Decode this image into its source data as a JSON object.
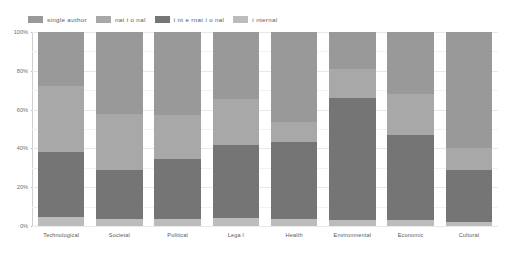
{
  "chart": {
    "type": "bar",
    "title": "",
    "xlabel": "",
    "ylabel": ""
  },
  "legend": {
    "position": "top-left",
    "items": [
      {
        "label": "single author",
        "color": "#999999"
      },
      {
        "label": "nat i o nal",
        "color": "#a8a8a8"
      },
      {
        "label": "i nt e rnat i o nal",
        "color": "#757575"
      },
      {
        "label": "i nternal",
        "color": "#bcbcbc"
      }
    ]
  },
  "yaxis": {
    "ticks": [
      "100%",
      "80%",
      "60%",
      "40%",
      "20%",
      "0%"
    ],
    "values": [
      100,
      80,
      60,
      40,
      20,
      0
    ],
    "min": 0,
    "max": 100
  },
  "chart_data": {
    "type": "bar",
    "stacked": true,
    "title": "",
    "xlabel": "",
    "ylabel": "",
    "ylim": [
      0,
      100
    ],
    "grid": true,
    "legend_position": "top-left",
    "categories": [
      "Technological",
      "Societal",
      "Political",
      "Lega l",
      "Health",
      "Environmental",
      "Economic",
      "Cultural"
    ],
    "series": [
      {
        "name": "single author",
        "color": "#999999",
        "values": [
          28.0,
          42.5,
          43.0,
          34.5,
          46.5,
          19.0,
          32.0,
          60.0
        ]
      },
      {
        "name": "nat i o nal",
        "color": "#a8a8a8",
        "values": [
          34.0,
          28.5,
          22.5,
          23.5,
          10.0,
          15.0,
          21.0,
          11.0
        ]
      },
      {
        "name": "i nt e rnat i o nal",
        "color": "#757575",
        "values": [
          33.5,
          25.5,
          31.0,
          38.0,
          40.0,
          63.0,
          44.0,
          27.0
        ]
      },
      {
        "name": "i nternal",
        "color": "#bcbcbc",
        "values": [
          4.5,
          3.5,
          3.5,
          4.0,
          3.5,
          3.0,
          3.0,
          2.0
        ]
      }
    ]
  },
  "colors": {
    "background": "#ffffff",
    "axis": "#cfcfcf",
    "grid": "#e9e9e9",
    "text": "#58595b"
  }
}
